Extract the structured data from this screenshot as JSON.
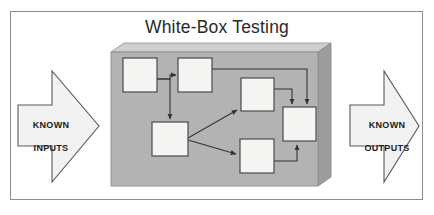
{
  "figure": {
    "title": "White-Box Testing",
    "frame_border_color": "#8c8c8c",
    "background_color": "#ffffff"
  },
  "inputs_arrow": {
    "label": "KNOWN\nINPUTS",
    "line1": "KNOWN",
    "line2": "INPUTS",
    "direction": "right",
    "fill_color": "#f2f2f2",
    "border_color": "#5a5a5a"
  },
  "outputs_arrow": {
    "label": "KNOWN\nOUTPUTS",
    "line1": "KNOWN",
    "line2": "OUTPUTS",
    "direction": "right",
    "fill_color": "#f2f2f2",
    "border_color": "#5a5a5a"
  },
  "system_box": {
    "name": "white-box-system",
    "front_fill": "#b0b0b0",
    "top_fill": "#cfcfcf",
    "side_fill": "#9a9a9a",
    "border_color": "#8f8f8f"
  },
  "flowchart": {
    "node_fill": "#f4f4f2",
    "node_border": "#4a4a4a",
    "connector_color": "#3a3a3a",
    "nodes": [
      {
        "id": "n1",
        "name": "node-top-left",
        "x": 123,
        "y": 58,
        "w": 34,
        "h": 34
      },
      {
        "id": "n2",
        "name": "node-top-mid",
        "x": 178,
        "y": 58,
        "w": 34,
        "h": 34
      },
      {
        "id": "n3",
        "name": "node-mid-right",
        "x": 241,
        "y": 78,
        "w": 33,
        "h": 33
      },
      {
        "id": "n4",
        "name": "node-bottom-left",
        "x": 152,
        "y": 122,
        "w": 36,
        "h": 34
      },
      {
        "id": "n5",
        "name": "node-bottom-mid",
        "x": 240,
        "y": 139,
        "w": 34,
        "h": 34
      },
      {
        "id": "n6",
        "name": "node-far-right",
        "x": 283,
        "y": 107,
        "w": 33,
        "h": 34
      }
    ],
    "edges": [
      {
        "from": "n1",
        "to": "n2",
        "name": "edge-n1-n2"
      },
      {
        "from": "n1",
        "to": "n4",
        "name": "edge-n1-n4"
      },
      {
        "from": "n2",
        "to": "n6",
        "name": "edge-n2-n6"
      },
      {
        "from": "n4",
        "to": "n3",
        "name": "edge-n4-n3"
      },
      {
        "from": "n4",
        "to": "n5",
        "name": "edge-n4-n5"
      },
      {
        "from": "n3",
        "to": "n6",
        "name": "edge-n3-n6"
      },
      {
        "from": "n5",
        "to": "n6",
        "name": "edge-n5-n6"
      }
    ]
  }
}
